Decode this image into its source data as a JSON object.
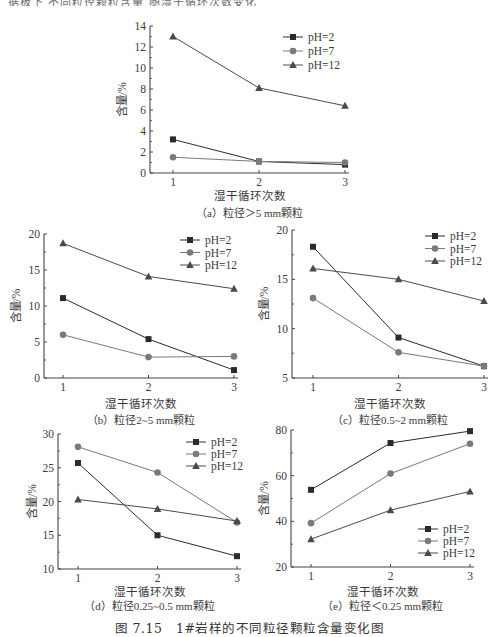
{
  "page": {
    "top_fragment": "据板下 不同粒径颗粒含量 随湿干循环次数变化",
    "figure_caption": "图 7.15　1#岩样的不同粒径颗粒含量变化图"
  },
  "legend_labels": [
    "pH=2",
    "pH=7",
    "pH=12"
  ],
  "chart_data": [
    {
      "id": "a",
      "type": "line",
      "title": "（a）粒径＞5 mm颗粒",
      "xlabel": "湿干循环次数",
      "ylabel": "含量/%",
      "x": [
        1,
        2,
        3
      ],
      "ylim": [
        0,
        14
      ],
      "yticks": [
        0,
        2,
        4,
        6,
        8,
        10,
        12,
        14
      ],
      "legend_position": "upper right",
      "series": [
        {
          "name": "pH=2",
          "marker": "square",
          "values": [
            3.2,
            1.1,
            0.8
          ]
        },
        {
          "name": "pH=7",
          "marker": "circle",
          "values": [
            1.5,
            1.1,
            1.0
          ]
        },
        {
          "name": "pH=12",
          "marker": "triangle",
          "values": [
            13.0,
            8.1,
            6.4
          ]
        }
      ]
    },
    {
      "id": "b",
      "type": "line",
      "title": "（b）粒径2~5 mm颗粒",
      "xlabel": "湿干循环次数",
      "ylabel": "含量/%",
      "x": [
        1,
        2,
        3
      ],
      "ylim": [
        0,
        20
      ],
      "yticks": [
        0,
        5,
        10,
        15,
        20
      ],
      "legend_position": "upper right",
      "series": [
        {
          "name": "pH=2",
          "marker": "square",
          "values": [
            11.1,
            5.4,
            1.1
          ]
        },
        {
          "name": "pH=7",
          "marker": "circle",
          "values": [
            6.0,
            2.9,
            3.0
          ]
        },
        {
          "name": "pH=12",
          "marker": "triangle",
          "values": [
            18.7,
            14.1,
            12.4
          ]
        }
      ]
    },
    {
      "id": "c",
      "type": "line",
      "title": "（c）粒径0.5~2 mm颗粒",
      "xlabel": "湿干循环次数",
      "ylabel": "含量/%",
      "x": [
        1,
        2,
        3
      ],
      "ylim": [
        5,
        20
      ],
      "yticks": [
        5,
        10,
        15,
        20
      ],
      "legend_position": "upper right",
      "series": [
        {
          "name": "pH=2",
          "marker": "square",
          "values": [
            18.3,
            9.1,
            6.2
          ]
        },
        {
          "name": "pH=7",
          "marker": "circle",
          "values": [
            13.1,
            7.6,
            6.2
          ]
        },
        {
          "name": "pH=12",
          "marker": "triangle",
          "values": [
            16.1,
            15.0,
            12.8
          ]
        }
      ]
    },
    {
      "id": "d",
      "type": "line",
      "title": "（d）粒径0.25~0.5 mm颗粒",
      "xlabel": "湿干循环次数",
      "ylabel": "含量/%",
      "x": [
        1,
        2,
        3
      ],
      "ylim": [
        10,
        30
      ],
      "yticks": [
        10,
        15,
        20,
        25,
        30
      ],
      "legend_position": "upper right",
      "series": [
        {
          "name": "pH=2",
          "marker": "square",
          "values": [
            25.7,
            15.0,
            11.9
          ]
        },
        {
          "name": "pH=7",
          "marker": "circle",
          "values": [
            28.1,
            24.3,
            16.9
          ]
        },
        {
          "name": "pH=12",
          "marker": "triangle",
          "values": [
            20.3,
            18.9,
            17.1
          ]
        }
      ]
    },
    {
      "id": "e",
      "type": "line",
      "title": "（e）粒径＜0.25 mm颗粒",
      "xlabel": "湿干循环次数",
      "ylabel": "含量/%",
      "x": [
        1,
        2,
        3
      ],
      "ylim": [
        20,
        80
      ],
      "yticks": [
        20,
        40,
        60,
        80
      ],
      "legend_position": "lower right",
      "series": [
        {
          "name": "pH=2",
          "marker": "square",
          "values": [
            53.8,
            74.3,
            79.5
          ]
        },
        {
          "name": "pH=7",
          "marker": "circle",
          "values": [
            39.2,
            60.9,
            74.0
          ]
        },
        {
          "name": "pH=12",
          "marker": "triangle",
          "values": [
            32.2,
            44.9,
            53.1
          ]
        }
      ]
    }
  ],
  "colors": {
    "pH=2": "#2b2b2b",
    "pH=7": "#7a7a7a",
    "pH=12": "#4a4a4a",
    "axis": "#444444"
  }
}
